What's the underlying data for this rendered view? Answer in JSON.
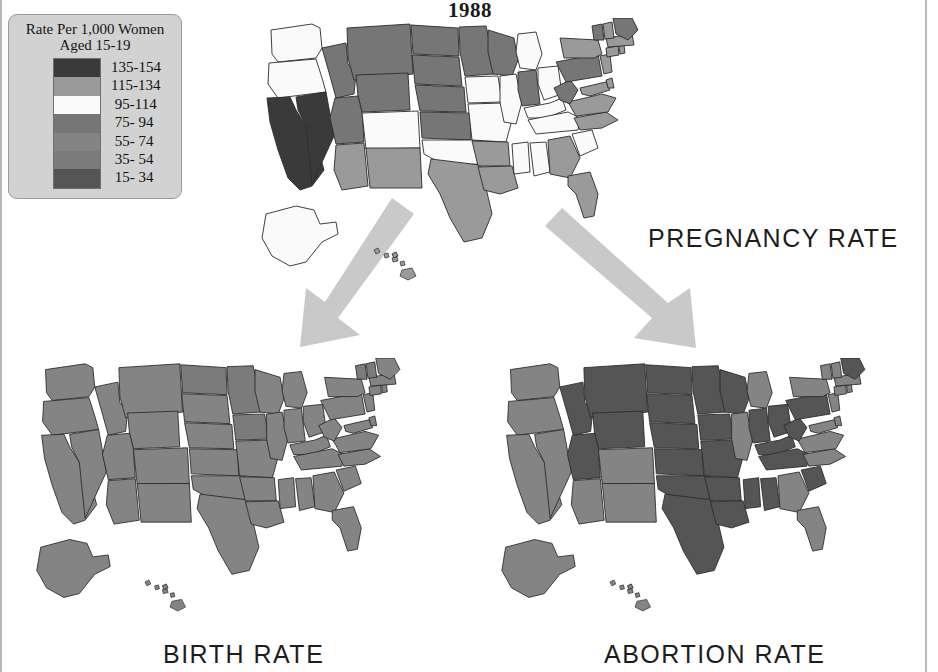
{
  "title": "1988",
  "legend": {
    "title_line1": "Rate Per 1,000 Women",
    "title_line2": "Aged 15-19",
    "box_color": "#d2d2d2",
    "classes": [
      {
        "label": "135-154",
        "color": "#3a3a3a",
        "min": 135,
        "max": 154
      },
      {
        "label": "115-134",
        "color": "#9a9a9a",
        "min": 115,
        "max": 134
      },
      {
        "label": " 95-114",
        "color": "#fafafa",
        "min": 95,
        "max": 114
      },
      {
        "label": " 75- 94",
        "color": "#767676",
        "min": 75,
        "max": 94
      },
      {
        "label": " 55- 74",
        "color": "#848484",
        "min": 55,
        "max": 74
      },
      {
        "label": " 35- 54",
        "color": "#7b7b7b",
        "min": 35,
        "max": 54
      },
      {
        "label": " 15- 34",
        "color": "#555555",
        "min": 15,
        "max": 34
      }
    ]
  },
  "maps": [
    {
      "id": "pregnancy",
      "caption": "PREGNANCY RATE"
    },
    {
      "id": "birth",
      "caption": "BIRTH RATE"
    },
    {
      "id": "abortion",
      "caption": "ABORTION RATE"
    }
  ],
  "arrows": {
    "color": "#c9c9c9",
    "left_arrow_name": "arrow-to-birth-rate",
    "right_arrow_name": "arrow-to-abortion-rate"
  },
  "chart_data": {
    "type": "heatmap",
    "title": "1988",
    "subtitle": "Rate Per 1,000 Women Aged 15-19",
    "legend_position": "top-left",
    "grid": false,
    "xlabel": "",
    "ylabel": "",
    "bins": [
      {
        "label": "135-154",
        "color": "#3a3a3a"
      },
      {
        "label": "115-134",
        "color": "#9a9a9a"
      },
      {
        "label": "95-114",
        "color": "#fafafa"
      },
      {
        "label": "75- 94",
        "color": "#767676"
      },
      {
        "label": "55- 74",
        "color": "#848484"
      },
      {
        "label": "35- 54",
        "color": "#7b7b7b"
      },
      {
        "label": "15- 34",
        "color": "#555555"
      }
    ],
    "panels": [
      {
        "name": "PREGNANCY RATE",
        "values": {
          "WA": "95-114",
          "OR": "95-114",
          "CA": "135-154",
          "NV": "135-154",
          "ID": "75- 94",
          "MT": "75- 94",
          "WY": "75- 94",
          "UT": "75- 94",
          "CO": "95-114",
          "AZ": "115-134",
          "NM": "115-134",
          "ND": "75- 94",
          "SD": "75- 94",
          "NE": "75- 94",
          "KS": "75- 94",
          "OK": "95-114",
          "TX": "115-134",
          "MN": "75- 94",
          "IA": "95-114",
          "MO": "95-114",
          "AR": "115-134",
          "LA": "115-134",
          "WI": "75- 94",
          "IL": "95-114",
          "MI": "95-114",
          "IN": "75- 94",
          "OH": "95-114",
          "KY": "95-114",
          "TN": "95-114",
          "MS": "95-114",
          "AL": "95-114",
          "GA": "115-134",
          "FL": "115-134",
          "SC": "95-114",
          "NC": "115-134",
          "VA": "115-134",
          "WV": "75- 94",
          "MD": "115-134",
          "DE": "115-134",
          "PA": "75- 94",
          "NJ": "115-134",
          "NY": "115-134",
          "CT": "115-134",
          "RI": "115-134",
          "MA": "115-134",
          "VT": "75- 94",
          "NH": "115-134",
          "ME": "75- 94",
          "AK": "95-114",
          "HI": "115-134"
        }
      },
      {
        "name": "BIRTH RATE",
        "values": {
          "WA": "55- 74",
          "OR": "55- 74",
          "CA": "55- 74",
          "NV": "55- 74",
          "ID": "55- 74",
          "MT": "55- 74",
          "WY": "55- 74",
          "UT": "55- 74",
          "CO": "55- 74",
          "AZ": "55- 74",
          "NM": "55- 74",
          "ND": "35- 54",
          "SD": "55- 74",
          "NE": "55- 74",
          "KS": "55- 74",
          "OK": "55- 74",
          "TX": "55- 74",
          "MN": "35- 54",
          "IA": "35- 54",
          "MO": "55- 74",
          "AR": "55- 74",
          "LA": "55- 74",
          "WI": "55- 74",
          "IL": "55- 74",
          "MI": "55- 74",
          "IN": "55- 74",
          "OH": "55- 74",
          "KY": "55- 74",
          "TN": "55- 74",
          "MS": "55- 74",
          "AL": "55- 74",
          "GA": "55- 74",
          "FL": "55- 74",
          "SC": "55- 74",
          "NC": "55- 74",
          "VA": "55- 74",
          "WV": "55- 74",
          "MD": "55- 74",
          "DE": "55- 74",
          "PA": "55- 74",
          "NJ": "55- 74",
          "NY": "55- 74",
          "CT": "55- 74",
          "RI": "55- 74",
          "MA": "55- 74",
          "VT": "35- 54",
          "NH": "35- 54",
          "ME": "55- 74",
          "AK": "55- 74",
          "HI": "55- 74"
        }
      },
      {
        "name": "ABORTION RATE",
        "values": {
          "WA": "55- 74",
          "OR": "55- 74",
          "CA": "55- 74",
          "NV": "55- 74",
          "ID": "15- 34",
          "MT": "15- 34",
          "WY": "15- 34",
          "UT": "15- 34",
          "CO": "55- 74",
          "AZ": "55- 74",
          "NM": "55- 74",
          "ND": "15- 34",
          "SD": "15- 34",
          "NE": "15- 34",
          "KS": "15- 34",
          "OK": "15- 34",
          "TX": "15- 34",
          "MN": "15- 34",
          "IA": "15- 34",
          "MO": "15- 34",
          "AR": "15- 34",
          "LA": "15- 34",
          "WI": "15- 34",
          "IL": "55- 74",
          "MI": "55- 74",
          "IN": "15- 34",
          "OH": "15- 34",
          "KY": "15- 34",
          "TN": "15- 34",
          "MS": "15- 34",
          "AL": "15- 34",
          "GA": "55- 74",
          "FL": "55- 74",
          "SC": "15- 34",
          "NC": "55- 74",
          "VA": "55- 74",
          "WV": "15- 34",
          "MD": "55- 74",
          "DE": "55- 74",
          "PA": "15- 34",
          "NJ": "55- 74",
          "NY": "55- 74",
          "CT": "55- 74",
          "RI": "55- 74",
          "MA": "55- 74",
          "VT": "55- 74",
          "NH": "55- 74",
          "ME": "15- 34",
          "AK": "55- 74",
          "HI": "55- 74"
        }
      }
    ]
  }
}
